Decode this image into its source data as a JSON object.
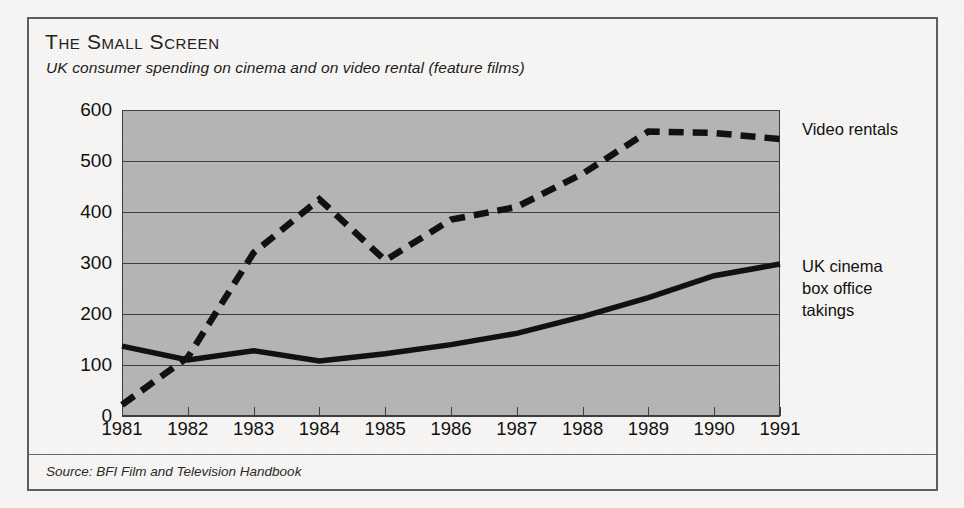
{
  "figure": {
    "title": "The Small Screen",
    "subtitle": "UK consumer spending on cinema and on video rental (feature films)",
    "source": "Source: BFI Film and Television Handbook",
    "unit_label": "£m"
  },
  "legend": {
    "video": "Video rentals",
    "cinema": "UK cinema\nbox office\ntakings"
  },
  "chart_data": {
    "type": "line",
    "title": "The Small Screen",
    "subtitle": "UK consumer spending on cinema and on video rental (feature films)",
    "xlabel": "",
    "ylabel": "£m",
    "ylim": [
      0,
      600
    ],
    "yticks": [
      0,
      100,
      200,
      300,
      400,
      500,
      600
    ],
    "ytick_labels": [
      "0",
      "100",
      "200",
      "300",
      "400",
      "500",
      "600"
    ],
    "categories": [
      "1981",
      "1982",
      "1983",
      "1984",
      "1985",
      "1986",
      "1987",
      "1988",
      "1989",
      "1990",
      "1991"
    ],
    "x": [
      1981,
      1982,
      1983,
      1984,
      1985,
      1986,
      1987,
      1988,
      1989,
      1990,
      1991
    ],
    "grid": "horizontal",
    "legend_position": "right",
    "plot_background": "#b4b4b4",
    "series": [
      {
        "name": "Video rentals",
        "style": "dashed",
        "color": "#111111",
        "values": [
          22,
          115,
          320,
          425,
          305,
          385,
          410,
          475,
          558,
          555,
          543
        ]
      },
      {
        "name": "UK cinema box office takings",
        "style": "solid",
        "color": "#111111",
        "values": [
          137,
          110,
          128,
          108,
          122,
          140,
          162,
          195,
          232,
          275,
          298
        ]
      }
    ]
  }
}
